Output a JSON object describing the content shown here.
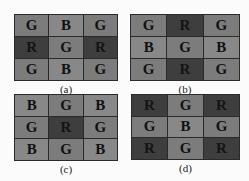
{
  "figure": {
    "panels": [
      {
        "caption": "(a)",
        "cells": [
          [
            "G",
            "B",
            "G"
          ],
          [
            "R",
            "G",
            "R"
          ],
          [
            "G",
            "B",
            "G"
          ]
        ]
      },
      {
        "caption": "(b)",
        "cells": [
          [
            "G",
            "R",
            "G"
          ],
          [
            "B",
            "G",
            "B"
          ],
          [
            "G",
            "R",
            "G"
          ]
        ]
      },
      {
        "caption": "(c)",
        "cells": [
          [
            "B",
            "G",
            "B"
          ],
          [
            "G",
            "R",
            "G"
          ],
          [
            "B",
            "G",
            "B"
          ]
        ]
      },
      {
        "caption": "(d)",
        "cells": [
          [
            "R",
            "G",
            "R"
          ],
          [
            "G",
            "B",
            "G"
          ],
          [
            "R",
            "G",
            "R"
          ]
        ]
      }
    ],
    "legend_colors": {
      "G": "#7c7c7c",
      "B": "#888888",
      "R": "#3e3e3e"
    }
  }
}
